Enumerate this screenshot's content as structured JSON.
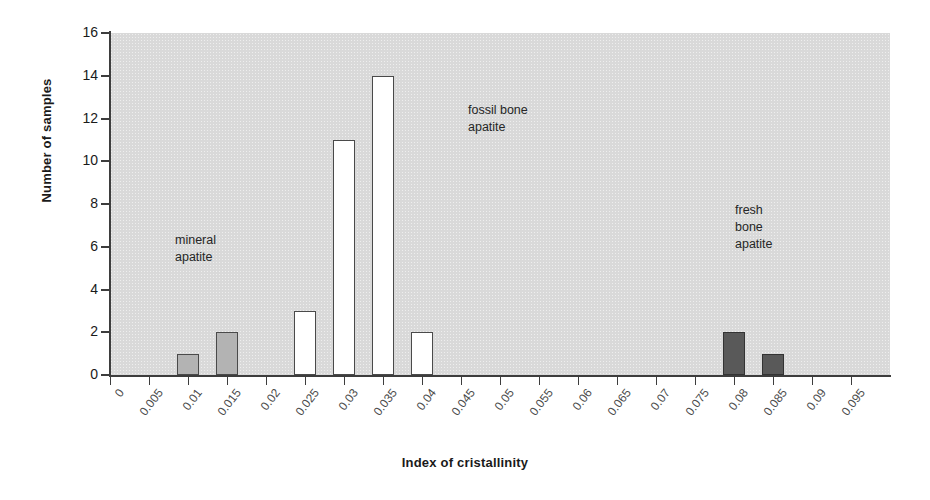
{
  "chart_data": {
    "type": "bar",
    "title": "",
    "xlabel": "Index of cristallinity",
    "ylabel": "Number of samples",
    "ylim": [
      0,
      16
    ],
    "y_ticks": [
      0,
      2,
      4,
      6,
      8,
      10,
      12,
      14,
      16
    ],
    "grid": false,
    "legend": "none",
    "categories": [
      "0",
      "0.005",
      "0.01",
      "0.015",
      "0.02",
      "0.025",
      "0.03",
      "0.035",
      "0.04",
      "0.045",
      "0.05",
      "0.055",
      "0.06",
      "0.065",
      "0.07",
      "0.075",
      "0.08",
      "0.085",
      "0.09",
      "0.095"
    ],
    "values": [
      0,
      0,
      1,
      2,
      0,
      3,
      11,
      14,
      2,
      0,
      0,
      0,
      0,
      0,
      0,
      0,
      2,
      1,
      0,
      0
    ],
    "bars": [
      {
        "x": "0.01",
        "value": 1,
        "group": "mineral"
      },
      {
        "x": "0.015",
        "value": 2,
        "group": "mineral"
      },
      {
        "x": "0.025",
        "value": 3,
        "group": "fossil"
      },
      {
        "x": "0.03",
        "value": 11,
        "group": "fossil"
      },
      {
        "x": "0.035",
        "value": 14,
        "group": "fossil"
      },
      {
        "x": "0.04",
        "value": 2,
        "group": "fossil"
      },
      {
        "x": "0.08",
        "value": 2,
        "group": "fresh"
      },
      {
        "x": "0.085",
        "value": 1,
        "group": "fresh"
      }
    ],
    "annotations": [
      {
        "id": "mineral",
        "text": "mineral\napatite"
      },
      {
        "id": "fossil",
        "text": "fossil bone\napatite"
      },
      {
        "id": "fresh",
        "text": "fresh\nbone\napatite"
      }
    ],
    "colors": {
      "mineral_apatite": "#b3b3b3",
      "fossil_bone_apatite": "#ffffff",
      "fresh_bone_apatite": "#595959",
      "plot_background": "#d9d9d9",
      "axis": "#3d3d3d",
      "page_background": "#ffffff"
    }
  },
  "axes": {
    "y_title": "Number of samples",
    "x_title": "Index of cristallinity"
  }
}
